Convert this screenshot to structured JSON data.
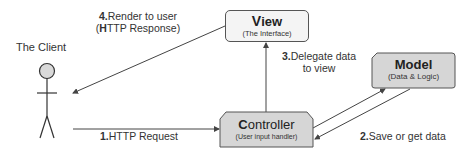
{
  "diagram": {
    "actor": {
      "label": "The Client"
    },
    "nodes": {
      "view": {
        "first_letter": "V",
        "rest": "iew",
        "subtitle": "(The Interface)",
        "fill": "#f4f4f4"
      },
      "model": {
        "first_letter": "M",
        "rest": "odel",
        "subtitle": "(Data & Logic)",
        "fill": "#d6d6d6"
      },
      "controller": {
        "first_letter": "C",
        "rest": "ontroller",
        "subtitle": "(User input handler)",
        "fill": "#d6d6d6"
      }
    },
    "edges": [
      {
        "num": "1.",
        "label": "HTTP Request",
        "from": "The Client",
        "to": "Controller"
      },
      {
        "num": "2.",
        "label": "Save or get data",
        "from": "Controller",
        "to": "Model",
        "bidirectional": true
      },
      {
        "num": "3.",
        "label_line1": "Delegate data",
        "label_line2": "to view",
        "from": "Controller",
        "to": "View"
      },
      {
        "num": "4.",
        "label_line1": "Render to user",
        "label_line2_open": "(",
        "label_line2_bold": "H",
        "label_line2_rest": "TTP Response)",
        "from": "View",
        "to": "The Client"
      }
    ],
    "colors": {
      "line": "#444444",
      "box_border": "#555555",
      "head_fill": "#d9d9d9"
    }
  }
}
